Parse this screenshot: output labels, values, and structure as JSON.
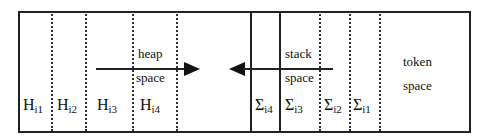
{
  "diagram": {
    "heap_labels": [
      {
        "base": "H",
        "sub": "i1"
      },
      {
        "base": "H",
        "sub": "i2"
      },
      {
        "base": "H",
        "sub": "i3"
      },
      {
        "base": "H",
        "sub": "i4"
      }
    ],
    "stack_labels": [
      {
        "base": "Σ",
        "sub": "i4"
      },
      {
        "base": "Σ",
        "sub": "i3"
      },
      {
        "base": "Σ",
        "sub": "i2"
      },
      {
        "base": "Σ",
        "sub": "i1"
      }
    ],
    "heap_space": {
      "line1": "heap",
      "line2": "space"
    },
    "stack_space": {
      "line1": "stack",
      "line2": "space"
    },
    "token_space": {
      "line1": "token",
      "line2": "space"
    }
  }
}
